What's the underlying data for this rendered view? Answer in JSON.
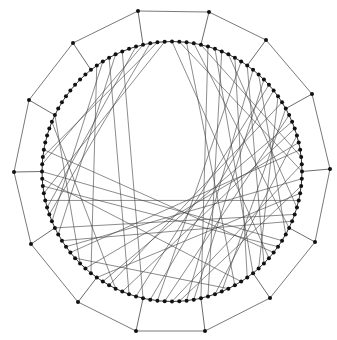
{
  "diagram": {
    "type": "graph",
    "colors": {
      "background": "#ffffff",
      "node": "#111111",
      "edge": "#3c3c3c",
      "outer_edge": "#6a6a6a"
    },
    "inner_ring": {
      "cx": 172,
      "cy": 171.5,
      "r": 130,
      "node_count": 112,
      "node_radius": 2,
      "start_angle_deg": -90
    },
    "outer_polygon": {
      "node_radius": 2,
      "vertices": [
        [
          138,
          11
        ],
        [
          209,
          12
        ],
        [
          266,
          40
        ],
        [
          312,
          94
        ],
        [
          330,
          169
        ],
        [
          315,
          242
        ],
        [
          270,
          298
        ],
        [
          205,
          331
        ],
        [
          136,
          331
        ],
        [
          78,
          302
        ],
        [
          31,
          244
        ],
        [
          14,
          172
        ],
        [
          29,
          100
        ],
        [
          73,
          43
        ]
      ]
    },
    "chord_skips": [
      41,
      27,
      45,
      33,
      22,
      47,
      38,
      29,
      44,
      25,
      36,
      48,
      31,
      42,
      24,
      39,
      46,
      28,
      35,
      43,
      26,
      40,
      34,
      47,
      30,
      37,
      23,
      45
    ]
  }
}
